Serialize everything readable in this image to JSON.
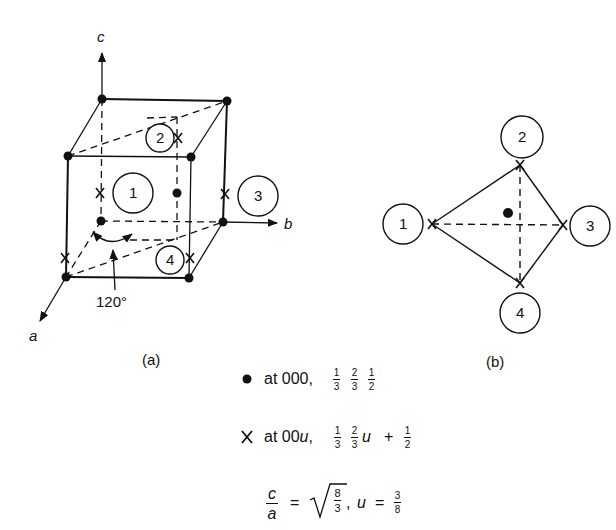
{
  "figure_a": {
    "caption": "(a)",
    "axes": {
      "a": "a",
      "b": "b",
      "c": "c"
    },
    "angle_label": "120°",
    "sites": [
      {
        "id": "1",
        "label": "1"
      },
      {
        "id": "2",
        "label": "2"
      },
      {
        "id": "3",
        "label": "3"
      },
      {
        "id": "4",
        "label": "4"
      }
    ]
  },
  "figure_b": {
    "caption": "(b)",
    "sites": [
      {
        "id": "1",
        "label": "1"
      },
      {
        "id": "2",
        "label": "2"
      },
      {
        "id": "3",
        "label": "3"
      },
      {
        "id": "4",
        "label": "4"
      }
    ]
  },
  "legend": {
    "dot_row": {
      "symbol": "dot",
      "prefix": "at 000,",
      "fractions": [
        {
          "num": "1",
          "den": "3"
        },
        {
          "num": "2",
          "den": "3"
        },
        {
          "num": "1",
          "den": "2"
        }
      ]
    },
    "x_row": {
      "symbol": "X",
      "prefix_text": "at 00",
      "prefix_var": "u",
      "prefix_comma": ",",
      "fractions": [
        {
          "num": "1",
          "den": "3"
        },
        {
          "num": "2",
          "den": "3"
        }
      ],
      "var": "u",
      "plus": "+",
      "last_fraction": {
        "num": "1",
        "den": "2"
      }
    },
    "ratio_row": {
      "lhs": {
        "num": "c",
        "den": "a"
      },
      "equals": "=",
      "sqrt_fraction": {
        "num": "8",
        "den": "3"
      },
      "comma": ",",
      "u_var": "u",
      "u_equals": "=",
      "u_fraction": {
        "num": "3",
        "den": "8"
      }
    }
  },
  "colors": {
    "ink": "#111111",
    "background": "#ffffff"
  }
}
